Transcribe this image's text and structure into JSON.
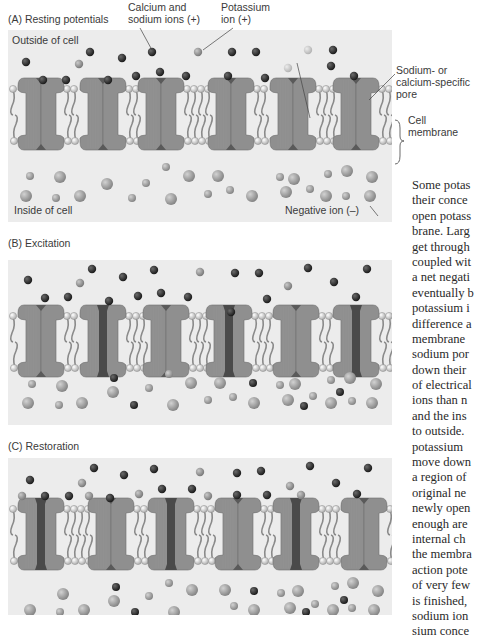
{
  "panels": [
    {
      "id": "A",
      "title": "(A)  Resting potentials",
      "top": 30,
      "height": 192,
      "membrane_y": 58,
      "labels": {
        "outside": "Outside of cell",
        "inside": "Inside of cell",
        "negative_ion": "Negative ion (–)"
      },
      "channels": [
        {
          "x": 10,
          "type": "sodium",
          "open": false
        },
        {
          "x": 72,
          "type": "sodium",
          "open": false
        },
        {
          "x": 130,
          "type": "sodium",
          "open": false
        },
        {
          "x": 200,
          "type": "sodium",
          "open": false
        },
        {
          "x": 262,
          "type": "potassium",
          "open": false
        },
        {
          "x": 325,
          "type": "sodium",
          "open": false
        }
      ],
      "ions_outside": [
        {
          "x": 18,
          "y": 32,
          "k": "na"
        },
        {
          "x": 82,
          "y": 22,
          "k": "na"
        },
        {
          "x": 114,
          "y": 28,
          "k": "na"
        },
        {
          "x": 144,
          "y": 22,
          "k": "na"
        },
        {
          "x": 224,
          "y": 22,
          "k": "na"
        },
        {
          "x": 248,
          "y": 22,
          "k": "na"
        },
        {
          "x": 325,
          "y": 20,
          "k": "na"
        },
        {
          "x": 35,
          "y": 50,
          "k": "na"
        },
        {
          "x": 58,
          "y": 50,
          "k": "na"
        },
        {
          "x": 100,
          "y": 50,
          "k": "na"
        },
        {
          "x": 128,
          "y": 46,
          "k": "na"
        },
        {
          "x": 152,
          "y": 42,
          "k": "na"
        },
        {
          "x": 178,
          "y": 46,
          "k": "na"
        },
        {
          "x": 220,
          "y": 46,
          "k": "na"
        },
        {
          "x": 257,
          "y": 48,
          "k": "na"
        },
        {
          "x": 323,
          "y": 36,
          "k": "na"
        },
        {
          "x": 346,
          "y": 46,
          "k": "na"
        },
        {
          "x": 71,
          "y": 34,
          "k": "k"
        },
        {
          "x": 190,
          "y": 22,
          "k": "k"
        },
        {
          "x": 300,
          "y": 20,
          "k": "kl"
        },
        {
          "x": 280,
          "y": 38,
          "k": "kl"
        }
      ],
      "ions_inside": [
        {
          "x": 22,
          "y": 146,
          "r": 4
        },
        {
          "x": 52,
          "y": 147,
          "r": 6
        },
        {
          "x": 99,
          "y": 154,
          "r": 6
        },
        {
          "x": 138,
          "y": 153,
          "r": 4
        },
        {
          "x": 158,
          "y": 137,
          "r": 4
        },
        {
          "x": 181,
          "y": 146,
          "r": 6
        },
        {
          "x": 210,
          "y": 146,
          "r": 6
        },
        {
          "x": 272,
          "y": 147,
          "r": 4
        },
        {
          "x": 286,
          "y": 149,
          "r": 6
        },
        {
          "x": 320,
          "y": 144,
          "r": 4
        },
        {
          "x": 339,
          "y": 141,
          "r": 6
        },
        {
          "x": 364,
          "y": 147,
          "r": 6
        },
        {
          "x": 18,
          "y": 166,
          "r": 6
        },
        {
          "x": 48,
          "y": 168,
          "r": 4
        },
        {
          "x": 72,
          "y": 166,
          "r": 6
        },
        {
          "x": 124,
          "y": 168,
          "r": 4
        },
        {
          "x": 163,
          "y": 169,
          "r": 6
        },
        {
          "x": 200,
          "y": 164,
          "r": 4
        },
        {
          "x": 222,
          "y": 160,
          "r": 4
        },
        {
          "x": 244,
          "y": 166,
          "r": 6
        },
        {
          "x": 278,
          "y": 162,
          "r": 6
        },
        {
          "x": 302,
          "y": 159,
          "r": 4
        },
        {
          "x": 318,
          "y": 166,
          "r": 6
        },
        {
          "x": 338,
          "y": 166,
          "r": 4
        },
        {
          "x": 362,
          "y": 166,
          "r": 6
        }
      ]
    },
    {
      "id": "B",
      "title": "(B)  Excitation",
      "top": 260,
      "height": 165,
      "membrane_y": 55,
      "channels": [
        {
          "x": 10,
          "type": "sodium",
          "open": false
        },
        {
          "x": 72,
          "type": "sodium",
          "open": true
        },
        {
          "x": 135,
          "type": "sodium",
          "open": false
        },
        {
          "x": 198,
          "type": "sodium",
          "open": true
        },
        {
          "x": 265,
          "type": "potassium",
          "open": false
        },
        {
          "x": 325,
          "type": "sodium",
          "open": true
        }
      ],
      "ions_outside": [
        {
          "x": 20,
          "y": 20,
          "k": "na"
        },
        {
          "x": 84,
          "y": 9,
          "k": "na"
        },
        {
          "x": 115,
          "y": 17,
          "k": "na"
        },
        {
          "x": 146,
          "y": 10,
          "k": "na"
        },
        {
          "x": 227,
          "y": 13,
          "k": "na"
        },
        {
          "x": 251,
          "y": 13,
          "k": "na"
        },
        {
          "x": 300,
          "y": 8,
          "k": "na"
        },
        {
          "x": 326,
          "y": 22,
          "k": "na"
        },
        {
          "x": 359,
          "y": 9,
          "k": "na"
        },
        {
          "x": 37,
          "y": 38,
          "k": "na"
        },
        {
          "x": 60,
          "y": 37,
          "k": "na"
        },
        {
          "x": 101,
          "y": 41,
          "k": "na"
        },
        {
          "x": 130,
          "y": 36,
          "k": "na"
        },
        {
          "x": 153,
          "y": 33,
          "k": "na"
        },
        {
          "x": 180,
          "y": 37,
          "k": "na"
        },
        {
          "x": 259,
          "y": 39,
          "k": "na"
        },
        {
          "x": 348,
          "y": 37,
          "k": "na"
        },
        {
          "x": 223,
          "y": 52,
          "k": "na"
        },
        {
          "x": 72,
          "y": 23,
          "k": "k"
        },
        {
          "x": 192,
          "y": 12,
          "k": "k"
        },
        {
          "x": 280,
          "y": 26,
          "k": "k"
        }
      ],
      "ions_inside": [
        {
          "x": 24,
          "y": 124,
          "r": 4
        },
        {
          "x": 54,
          "y": 126,
          "r": 6
        },
        {
          "x": 106,
          "y": 118,
          "r": 4,
          "k": "na"
        },
        {
          "x": 105,
          "y": 132,
          "r": 6
        },
        {
          "x": 141,
          "y": 128,
          "r": 4
        },
        {
          "x": 161,
          "y": 114,
          "r": 4
        },
        {
          "x": 183,
          "y": 123,
          "r": 6
        },
        {
          "x": 212,
          "y": 123,
          "r": 6
        },
        {
          "x": 245,
          "y": 123,
          "r": 4,
          "k": "na"
        },
        {
          "x": 272,
          "y": 125,
          "r": 4
        },
        {
          "x": 287,
          "y": 124,
          "r": 6
        },
        {
          "x": 323,
          "y": 120,
          "r": 4
        },
        {
          "x": 342,
          "y": 118,
          "r": 6
        },
        {
          "x": 368,
          "y": 124,
          "r": 6
        },
        {
          "x": 20,
          "y": 143,
          "r": 6
        },
        {
          "x": 51,
          "y": 145,
          "r": 4
        },
        {
          "x": 74,
          "y": 143,
          "r": 6
        },
        {
          "x": 126,
          "y": 145,
          "r": 4,
          "k": "na"
        },
        {
          "x": 165,
          "y": 145,
          "r": 6
        },
        {
          "x": 200,
          "y": 140,
          "r": 4
        },
        {
          "x": 225,
          "y": 137,
          "r": 4
        },
        {
          "x": 246,
          "y": 143,
          "r": 6
        },
        {
          "x": 280,
          "y": 140,
          "r": 6
        },
        {
          "x": 296,
          "y": 146,
          "r": 4,
          "k": "na"
        },
        {
          "x": 305,
          "y": 136,
          "r": 4
        },
        {
          "x": 323,
          "y": 143,
          "r": 6
        },
        {
          "x": 332,
          "y": 132,
          "r": 4,
          "k": "na"
        },
        {
          "x": 344,
          "y": 141,
          "r": 4
        },
        {
          "x": 364,
          "y": 143,
          "r": 6
        }
      ]
    },
    {
      "id": "C",
      "title": "(C)  Restoration",
      "top": 458,
      "height": 157,
      "membrane_y": 50,
      "channels": [
        {
          "x": 10,
          "type": "sodium",
          "open": true
        },
        {
          "x": 80,
          "type": "sodium",
          "open": false
        },
        {
          "x": 140,
          "type": "sodium",
          "open": true
        },
        {
          "x": 207,
          "type": "sodium",
          "open": false
        },
        {
          "x": 265,
          "type": "potassium",
          "open": true
        },
        {
          "x": 333,
          "type": "sodium",
          "open": false
        }
      ],
      "ions_outside": [
        {
          "x": 22,
          "y": 22,
          "k": "na"
        },
        {
          "x": 86,
          "y": 10,
          "k": "na"
        },
        {
          "x": 116,
          "y": 17,
          "k": "na"
        },
        {
          "x": 146,
          "y": 11,
          "k": "na"
        },
        {
          "x": 229,
          "y": 15,
          "k": "na"
        },
        {
          "x": 253,
          "y": 13,
          "k": "na"
        },
        {
          "x": 302,
          "y": 8,
          "k": "na"
        },
        {
          "x": 328,
          "y": 25,
          "k": "na"
        },
        {
          "x": 360,
          "y": 10,
          "k": "na"
        },
        {
          "x": 37,
          "y": 38,
          "k": "na"
        },
        {
          "x": 61,
          "y": 38,
          "k": "na"
        },
        {
          "x": 102,
          "y": 40,
          "k": "na"
        },
        {
          "x": 154,
          "y": 31,
          "k": "na"
        },
        {
          "x": 184,
          "y": 31,
          "k": "na"
        },
        {
          "x": 229,
          "y": 37,
          "k": "na"
        },
        {
          "x": 259,
          "y": 37,
          "k": "na"
        },
        {
          "x": 349,
          "y": 36,
          "k": "na"
        },
        {
          "x": 74,
          "y": 25,
          "k": "k"
        },
        {
          "x": 192,
          "y": 14,
          "k": "k"
        },
        {
          "x": 282,
          "y": 28,
          "k": "k"
        },
        {
          "x": 14,
          "y": 38,
          "k": "k"
        },
        {
          "x": 81,
          "y": 38,
          "k": "k"
        },
        {
          "x": 131,
          "y": 36,
          "k": "k"
        },
        {
          "x": 200,
          "y": 38,
          "k": "k"
        },
        {
          "x": 293,
          "y": 37,
          "k": "k"
        }
      ],
      "ions_inside": [
        {
          "x": 55,
          "y": 136,
          "r": 6
        },
        {
          "x": 108,
          "y": 129,
          "r": 4,
          "k": "na"
        },
        {
          "x": 106,
          "y": 143,
          "r": 6
        },
        {
          "x": 141,
          "y": 138,
          "r": 4
        },
        {
          "x": 161,
          "y": 125,
          "r": 4
        },
        {
          "x": 184,
          "y": 132,
          "r": 6
        },
        {
          "x": 217,
          "y": 132,
          "r": 6
        },
        {
          "x": 246,
          "y": 133,
          "r": 4,
          "k": "na"
        },
        {
          "x": 273,
          "y": 135,
          "r": 4
        },
        {
          "x": 290,
          "y": 133,
          "r": 6
        },
        {
          "x": 327,
          "y": 128,
          "r": 4
        },
        {
          "x": 345,
          "y": 125,
          "r": 6
        },
        {
          "x": 370,
          "y": 133,
          "r": 6
        },
        {
          "x": 22,
          "y": 152,
          "r": 6
        },
        {
          "x": 52,
          "y": 154,
          "r": 4
        },
        {
          "x": 76,
          "y": 152,
          "r": 6
        },
        {
          "x": 127,
          "y": 154,
          "r": 4,
          "k": "na"
        },
        {
          "x": 166,
          "y": 154,
          "r": 6
        },
        {
          "x": 226,
          "y": 148,
          "r": 4
        },
        {
          "x": 246,
          "y": 152,
          "r": 6
        },
        {
          "x": 282,
          "y": 150,
          "r": 6
        },
        {
          "x": 298,
          "y": 154,
          "r": 4,
          "k": "na"
        },
        {
          "x": 307,
          "y": 146,
          "r": 4
        },
        {
          "x": 325,
          "y": 152,
          "r": 6
        },
        {
          "x": 336,
          "y": 142,
          "r": 4,
          "k": "na"
        },
        {
          "x": 344,
          "y": 150,
          "r": 4
        },
        {
          "x": 366,
          "y": 152,
          "r": 6
        }
      ]
    }
  ],
  "callouts": {
    "calcium_sodium": "Calcium and\nsodium ions (+)",
    "calcium_sodium_line1": "Calcium and",
    "calcium_sodium_line2": "sodium ions (+)",
    "potassium_line1": "Potassium",
    "potassium_line2": "ion (+)",
    "potassium_pore_line1": "Potassium-specific",
    "potassium_pore_line2": "pore",
    "sodium_pore_line1": "Sodium- or",
    "sodium_pore_line2": "calcium-specific",
    "sodium_pore_line3": "pore",
    "membrane_line1": "Cell",
    "membrane_line2": "membrane"
  },
  "body_text": {
    "lines": [
      "Some potas",
      "their conce",
      "open potass",
      "brane. Larg",
      "get through",
      "coupled wit",
      "a net negati",
      "eventually b",
      "potassium i",
      "difference a",
      "membrane",
      "sodium por",
      "down their",
      "of electrical",
      "ions than n",
      "and the ins",
      "to outside.",
      "potassium",
      "move down",
      "a region of",
      "original ne",
      "newly open",
      "enough are",
      "internal ch",
      "the membra",
      "action pote",
      "of very few",
      "is finished,",
      "sodium ion",
      "sium conce"
    ]
  },
  "colors": {
    "panel_bg": "#ececec",
    "channel_fill": "#8f8f8f",
    "channel_stroke": "#6f6f6f",
    "pore_dark": "#4a4a4a",
    "sodium_ion": "#2e2e2e",
    "potassium_ion": "#909090",
    "potassium_light": "#c4c4c4",
    "negative_ion": "#9a9a9a"
  }
}
